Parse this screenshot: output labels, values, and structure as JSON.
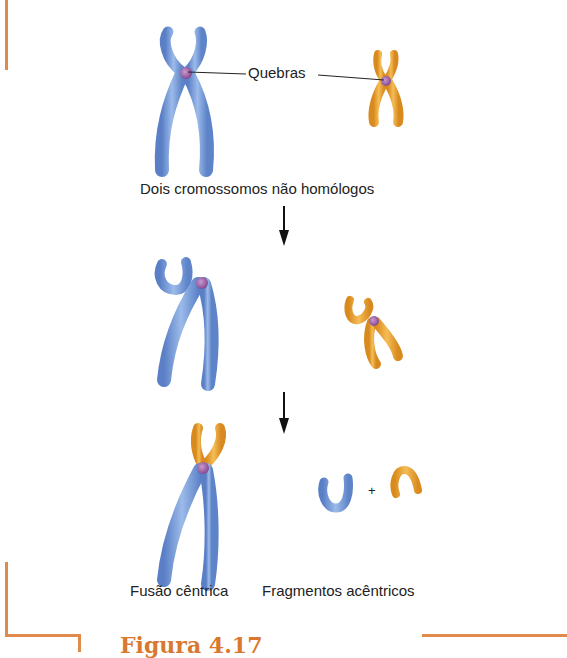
{
  "diagram": {
    "figure_title": "Figura 4.17",
    "labels": {
      "breaks": "Quebras",
      "step1_caption": "Dois cromossomos não homólogos",
      "fusion_caption": "Fusão cêntrica",
      "fragments_caption": "Fragmentos acêntricos",
      "plus_sign": "+"
    },
    "colors": {
      "large_chromosome": "#7b9fdc",
      "small_chromosome": "#e8a033",
      "centromere": "#9a5ea0",
      "frame_accent": "#e08a4c",
      "title_accent": "#d9782f"
    },
    "steps": [
      {
        "name": "two-nonhomologous-chromosomes"
      },
      {
        "name": "broken-chromosomes"
      },
      {
        "name": "centric-fusion-and-acentric-fragments"
      }
    ]
  }
}
